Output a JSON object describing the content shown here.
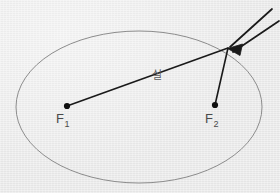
{
  "figure": {
    "background_color": "#ebebeb",
    "ellipse_stroke_color": "#8c8c8c",
    "string_color": "#1a1a1a",
    "label_color": "#4a4a4a",
    "canvas": {
      "width": 280,
      "height": 193
    }
  },
  "ellipse": {
    "name": "ellipse-curve",
    "center_x": 139,
    "center_y": 107,
    "radius_x": 123,
    "radius_y": 76,
    "stroke_width": 1
  },
  "foci": [
    {
      "id": "f1",
      "label": "F",
      "subscript": "1",
      "x": 67,
      "y": 106,
      "dot_radius": 3.1
    },
    {
      "id": "f2",
      "label": "F",
      "subscript": "2",
      "x": 215,
      "y": 105,
      "dot_radius": 3.1
    }
  ],
  "string": {
    "label": "실",
    "label_x": 152,
    "label_y": 70,
    "pencil_point_x": 228,
    "pencil_point_y": 48,
    "segments": [
      {
        "name": "string-segment-f1",
        "x1": 67,
        "y1": 106,
        "x2": 228,
        "y2": 48
      },
      {
        "name": "string-segment-f2",
        "x1": 215,
        "y1": 105,
        "x2": 228,
        "y2": 48
      }
    ],
    "stroke_width": 1.6
  },
  "pencil": {
    "name": "pencil",
    "tip_x": 228,
    "tip_y": 48,
    "upper_edge_x": 272,
    "upper_edge_y": 9,
    "lower_edge_x": 279,
    "lower_edge_y": 21,
    "tip_fill_color": "#1a1a1a",
    "body_stroke_color": "#1a1a1a",
    "stroke_width": 1.6
  }
}
